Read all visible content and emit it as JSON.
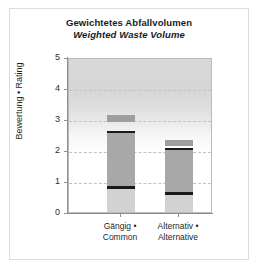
{
  "figure": {
    "title_de": "Gewichtetes Abfallvolumen",
    "title_en": "Weighted Waste Volume"
  },
  "chart_data": {
    "type": "bar",
    "subtitle": "Weighted Waste Volume",
    "xlabel": "",
    "ylabel": "Bewertung • Rating",
    "ylim": [
      0,
      5
    ],
    "yticks": [
      0,
      1,
      2,
      3,
      4,
      5
    ],
    "ytick_labels": [
      "0",
      "1",
      "2",
      "3",
      "4",
      "5"
    ],
    "grid": "horizontal-dashed",
    "legend": "none",
    "categories": [
      "Gängig • Common",
      "Alternativ • Alternative"
    ],
    "category_labels": [
      {
        "line1": "Gängig •",
        "line2": "Common"
      },
      {
        "line1": "Alternativ •",
        "line2": "Alternative"
      }
    ],
    "series": [
      {
        "name": "Gängig • Common",
        "box_low": 0.8,
        "box_high": 2.62,
        "median": 0.78,
        "upper_cap_low": 2.9,
        "upper_cap_high": 3.12,
        "lower_tail_low": 0.0,
        "lower_tail_high": 0.8,
        "value": 2.62
      },
      {
        "name": "Alternativ • Alternative",
        "box_low": 0.62,
        "box_high": 2.05,
        "median": 0.6,
        "upper_cap_low": 2.12,
        "upper_cap_high": 2.32,
        "lower_tail_low": 0.0,
        "lower_tail_high": 0.62,
        "value": 2.05
      }
    ],
    "colors": {
      "box_fill": "#a8a8a8",
      "cap_fill": "#9e9e9e",
      "tail_fill": "#d2d2d2",
      "median_line": "#1a1a1a",
      "plot_bg_top": "#d8d8d8",
      "plot_bg_bottom": "#ffffff",
      "gridline": "#c2c2c2",
      "axis": "#8f8f8f",
      "text": "#1a1a1a"
    }
  }
}
